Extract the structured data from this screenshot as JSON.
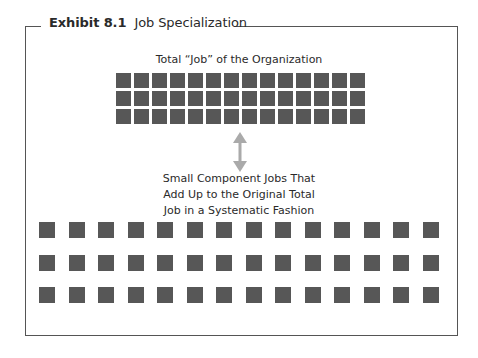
{
  "exhibit": {
    "number": "Exhibit 8.1",
    "title": "Job Specialization"
  },
  "diagram": {
    "top_label": "Total “Job” of the Organization",
    "top_grid": {
      "rows": 3,
      "columns": 14,
      "style": "tightly packed"
    },
    "connector": "double-arrow-icon",
    "caption_lines": [
      "Small Component Jobs That",
      "Add Up to the Original Total",
      "Job in a Systematic Fashion"
    ],
    "bottom_grid": {
      "rows": 3,
      "columns": 14,
      "style": "spaced apart"
    }
  },
  "colors": {
    "square": "#575757",
    "arrow": "#aaaaaa",
    "frame": "#555555"
  }
}
